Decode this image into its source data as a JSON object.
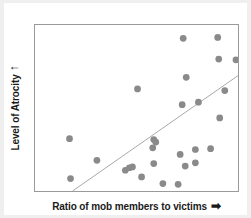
{
  "figure": {
    "background_color": "#efefef",
    "sheet_color": "#ffffff"
  },
  "axes": {
    "y": {
      "label": "Level of Atrocity",
      "arrow": "↑",
      "arrow_name": "y-axis-arrow"
    },
    "x": {
      "label": "Ratio of mob members to victims",
      "arrow": "➡",
      "arrow_name": "x-axis-arrow"
    }
  },
  "chart_data": {
    "type": "scatter",
    "title": "",
    "xlabel": "Ratio of mob members to victims",
    "ylabel": "Level of Atrocity",
    "xlim": [
      0,
      100
    ],
    "ylim": [
      0,
      100
    ],
    "grid": false,
    "legend": false,
    "tick_labels": {
      "x": [],
      "y": []
    },
    "marker": {
      "shape": "circle",
      "color": "#8a8a8a",
      "radius_px": 3.4
    },
    "trendline": {
      "visible": true,
      "color": "#a8a8a8",
      "width_px": 1,
      "direction": "positive",
      "x0": 18.5,
      "y0": 0,
      "x1": 100,
      "y1": 69.5
    },
    "series": [
      {
        "name": "observations",
        "points": [
          [
            17.0,
            31.5
          ],
          [
            17.5,
            7.5
          ],
          [
            30.5,
            18.5
          ],
          [
            44.5,
            12.5
          ],
          [
            46.5,
            14.0
          ],
          [
            52.5,
            8.5
          ],
          [
            50.5,
            61.5
          ],
          [
            58.5,
            31.0
          ],
          [
            58.0,
            26.0
          ],
          [
            58.5,
            16.5
          ],
          [
            63.0,
            4.5
          ],
          [
            70.5,
            4.0
          ],
          [
            74.0,
            15.0
          ],
          [
            79.0,
            17.0
          ],
          [
            86.5,
            25.5
          ],
          [
            73.0,
            92.0
          ],
          [
            74.5,
            68.5
          ],
          [
            72.5,
            52.0
          ],
          [
            80.5,
            53.5
          ],
          [
            90.0,
            92.5
          ],
          [
            90.5,
            79.5
          ],
          [
            93.5,
            60.5
          ],
          [
            91.0,
            44.0
          ],
          [
            99.0,
            79.0
          ],
          [
            79.0,
            25.0
          ],
          [
            48.0,
            14.5
          ],
          [
            59.5,
            29.5
          ],
          [
            71.5,
            22.0
          ]
        ]
      }
    ]
  }
}
